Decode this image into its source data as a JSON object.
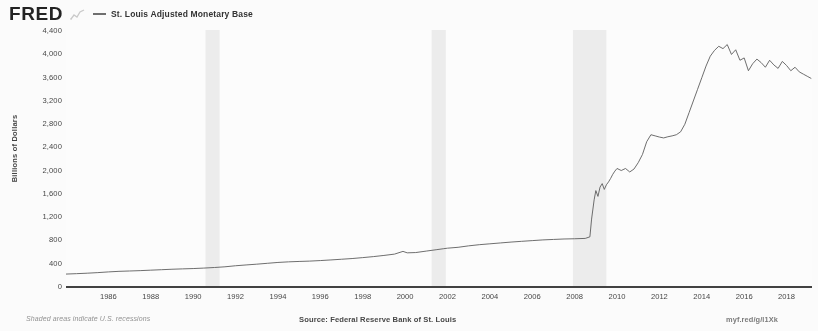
{
  "header": {
    "logo": "FRED",
    "logo_glyph_icon": "mini-line-chart-icon",
    "legend": {
      "swatch_icon": "line-swatch-icon",
      "label": "St. Louis Adjusted Monetary Base",
      "color": "#6a6a6a"
    }
  },
  "footer": {
    "left_note": "Shaded areas indicate U.S. recessions",
    "source": "Source: Federal Reserve Bank of St. Louis",
    "permalink": "myf.red/g/l1Xk"
  },
  "chart_data": {
    "type": "line",
    "title": "St. Louis Adjusted Monetary Base",
    "xlabel": "",
    "ylabel": "Billions of Dollars",
    "ylim": [
      0,
      4400
    ],
    "xlim": [
      1984.0,
      2019.2
    ],
    "grid": false,
    "legend_position": "top",
    "line_color": "#585858",
    "recession_band_color": "#eeeeee",
    "ytick_labels": [
      "0",
      "400",
      "800",
      "1,200",
      "1,600",
      "2,000",
      "2,400",
      "2,800",
      "3,200",
      "3,600",
      "4,000",
      "4,400"
    ],
    "ytick_values": [
      0,
      400,
      800,
      1200,
      1600,
      2000,
      2400,
      2800,
      3200,
      3600,
      4000,
      4400
    ],
    "xtick_labels": [
      "1986",
      "1988",
      "1990",
      "1992",
      "1994",
      "1996",
      "1998",
      "2000",
      "2002",
      "2004",
      "2006",
      "2008",
      "2010",
      "2012",
      "2014",
      "2016",
      "2018"
    ],
    "xtick_values": [
      1986,
      1988,
      1990,
      1992,
      1994,
      1996,
      1998,
      2000,
      2002,
      2004,
      2006,
      2008,
      2010,
      2012,
      2014,
      2016,
      2018
    ],
    "recessions": [
      {
        "start": 1990.58,
        "end": 1991.25
      },
      {
        "start": 2001.25,
        "end": 2001.92
      },
      {
        "start": 2007.92,
        "end": 2009.5
      }
    ],
    "series": [
      {
        "name": "St. Louis Adjusted Monetary Base",
        "x": [
          1984.0,
          1984.5,
          1985.0,
          1985.5,
          1986.0,
          1986.5,
          1987.0,
          1987.5,
          1988.0,
          1988.5,
          1989.0,
          1989.5,
          1990.0,
          1990.5,
          1991.0,
          1991.5,
          1992.0,
          1992.5,
          1993.0,
          1993.5,
          1994.0,
          1994.5,
          1995.0,
          1995.5,
          1996.0,
          1996.5,
          1997.0,
          1997.5,
          1998.0,
          1998.5,
          1999.0,
          1999.5,
          1999.9,
          2000.1,
          2000.5,
          2001.0,
          2001.5,
          2001.8,
          2002.0,
          2002.5,
          2003.0,
          2003.5,
          2004.0,
          2004.5,
          2005.0,
          2005.5,
          2006.0,
          2006.5,
          2007.0,
          2007.5,
          2008.0,
          2008.5,
          2008.72,
          2008.8,
          2008.92,
          2009.0,
          2009.1,
          2009.2,
          2009.3,
          2009.4,
          2009.5,
          2009.6,
          2009.7,
          2009.8,
          2009.9,
          2010.0,
          2010.2,
          2010.4,
          2010.6,
          2010.8,
          2011.0,
          2011.2,
          2011.4,
          2011.6,
          2011.8,
          2012.0,
          2012.2,
          2012.4,
          2012.6,
          2012.8,
          2013.0,
          2013.2,
          2013.4,
          2013.6,
          2013.8,
          2014.0,
          2014.2,
          2014.4,
          2014.6,
          2014.8,
          2015.0,
          2015.2,
          2015.4,
          2015.6,
          2015.8,
          2016.0,
          2016.2,
          2016.4,
          2016.6,
          2016.8,
          2017.0,
          2017.2,
          2017.4,
          2017.6,
          2017.8,
          2018.0,
          2018.2,
          2018.4,
          2018.6,
          2018.8,
          2019.0,
          2019.15
        ],
        "y": [
          205,
          212,
          220,
          230,
          242,
          252,
          258,
          264,
          272,
          280,
          288,
          294,
          300,
          308,
          318,
          330,
          348,
          362,
          375,
          390,
          405,
          415,
          422,
          428,
          437,
          448,
          460,
          472,
          488,
          505,
          525,
          548,
          595,
          570,
          575,
          600,
          625,
          640,
          650,
          665,
          690,
          710,
          725,
          740,
          755,
          768,
          780,
          792,
          800,
          808,
          812,
          818,
          845,
          1150,
          1480,
          1640,
          1540,
          1700,
          1760,
          1660,
          1740,
          1790,
          1850,
          1920,
          1975,
          2020,
          1985,
          2020,
          1960,
          2010,
          2120,
          2260,
          2480,
          2600,
          2580,
          2560,
          2545,
          2565,
          2580,
          2600,
          2650,
          2780,
          2980,
          3180,
          3380,
          3580,
          3780,
          3950,
          4050,
          4120,
          4080,
          4150,
          3980,
          4060,
          3880,
          3920,
          3700,
          3820,
          3900,
          3840,
          3760,
          3880,
          3800,
          3740,
          3860,
          3790,
          3700,
          3760,
          3680,
          3640,
          3600,
          3570
        ]
      }
    ]
  }
}
